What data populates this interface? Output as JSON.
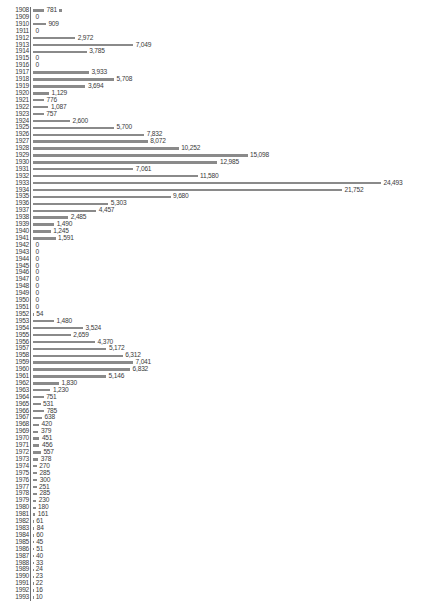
{
  "chart_data": {
    "type": "bar",
    "orientation": "horizontal",
    "title": "",
    "subtitle": "",
    "xlabel": "",
    "ylabel": "",
    "grid": false,
    "legend": null,
    "axis_line": "left-vertical",
    "xlim": [
      0,
      24493
    ],
    "value_label_format": "comma-separated thousands",
    "bar_color": "#8a8a8a",
    "text_color": "#3a3a3a",
    "background": "#ffffff",
    "annotations": [
      {
        "category": "1908",
        "symbol": "marker-square",
        "note": "small square marker after value label"
      }
    ],
    "categories": [
      "1908",
      "1909",
      "1910",
      "1911",
      "1912",
      "1913",
      "1914",
      "1915",
      "1916",
      "1917",
      "1918",
      "1919",
      "1920",
      "1921",
      "1922",
      "1923",
      "1924",
      "1925",
      "1926",
      "1927",
      "1928",
      "1929",
      "1930",
      "1931",
      "1932",
      "1933",
      "1934",
      "1935",
      "1936",
      "1937",
      "1938",
      "1939",
      "1940",
      "1941",
      "1942",
      "1943",
      "1944",
      "1945",
      "1946",
      "1947",
      "1948",
      "1949",
      "1950",
      "1951",
      "1952",
      "1953",
      "1954",
      "1955",
      "1956",
      "1957",
      "1958",
      "1959",
      "1960",
      "1961",
      "1962",
      "1963",
      "1964",
      "1965",
      "1966",
      "1967",
      "1968",
      "1969",
      "1970",
      "1971",
      "1972",
      "1973",
      "1974",
      "1975",
      "1976",
      "1977",
      "1978",
      "1979",
      "1980",
      "1981",
      "1982",
      "1983",
      "1984",
      "1985",
      "1986",
      "1987",
      "1988",
      "1989",
      "1990",
      "1991",
      "1992",
      "1993"
    ],
    "values": [
      781,
      0,
      909,
      0,
      2972,
      7049,
      3785,
      0,
      0,
      3933,
      5708,
      3694,
      1129,
      776,
      1087,
      757,
      2600,
      5700,
      7832,
      8072,
      10252,
      15098,
      12985,
      7061,
      11580,
      24493,
      21752,
      9680,
      5303,
      4457,
      2485,
      1490,
      1245,
      1591,
      0,
      0,
      0,
      0,
      0,
      0,
      0,
      0,
      0,
      0,
      54,
      1480,
      3524,
      2659,
      4370,
      5172,
      6312,
      7041,
      6832,
      5146,
      1830,
      1230,
      751,
      531,
      785,
      638,
      420,
      379,
      451,
      456,
      557,
      378,
      270,
      285,
      300,
      251,
      285,
      230,
      180,
      161,
      61,
      84,
      60,
      45,
      51,
      40,
      33,
      24,
      23,
      22,
      16,
      10
    ],
    "value_labels": [
      "781",
      "0",
      "909",
      "0",
      "2,972",
      "7,049",
      "3,785",
      "0",
      "0",
      "3,933",
      "5,708",
      "3,694",
      "1,129",
      "776",
      "1,087",
      "757",
      "2,600",
      "5,700",
      "7,832",
      "8,072",
      "10,252",
      "15,098",
      "12,985",
      "7,061",
      "11,580",
      "24,493",
      "21,752",
      "9,680",
      "5,303",
      "4,457",
      "2,485",
      "1,490",
      "1,245",
      "1,591",
      "0",
      "0",
      "0",
      "0",
      "0",
      "0",
      "0",
      "0",
      "0",
      "0",
      "54",
      "1,480",
      "3,524",
      "2,659",
      "4,370",
      "5,172",
      "6,312",
      "7,041",
      "6,832",
      "5,146",
      "1,830",
      "1,230",
      "751",
      "531",
      "785",
      "638",
      "420",
      "379",
      "451",
      "456",
      "557",
      "378",
      "270",
      "285",
      "300",
      "251",
      "285",
      "230",
      "180",
      "161",
      "61",
      "84",
      "60",
      "45",
      "51",
      "40",
      "33",
      "24",
      "23",
      "22",
      "16",
      "10"
    ]
  }
}
